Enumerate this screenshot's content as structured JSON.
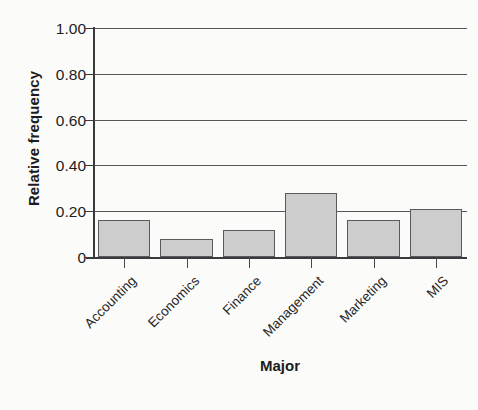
{
  "chart_data": {
    "type": "bar",
    "title": "",
    "xlabel": "Major",
    "ylabel": "Relative frequency",
    "categories": [
      "Accounting",
      "Economics",
      "Finance",
      "Management",
      "Marketing",
      "MIS"
    ],
    "values": [
      0.16,
      0.08,
      0.12,
      0.28,
      0.16,
      0.21
    ],
    "ylim": [
      0,
      1.0
    ],
    "ytick_labels": [
      "0",
      "0.20",
      "0.40",
      "0.60",
      "0.80",
      "1.00"
    ],
    "ytick_values": [
      0,
      0.2,
      0.4,
      0.6,
      0.8,
      1.0
    ],
    "grid": "horizontal",
    "legend": "none",
    "bar_fill_color": "#cdcdcd",
    "bar_edge_color": "#5a5a5c",
    "axis_color": "#3a3a3c",
    "grid_color": "#58585a"
  }
}
